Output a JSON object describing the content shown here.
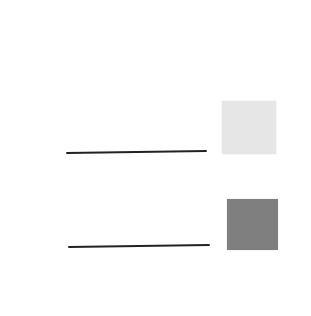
{
  "diagram": {
    "background": "#ffffff",
    "items": [
      {
        "id": "item-1",
        "label": "",
        "line": {
          "x1": 66,
          "y1": 153,
          "x2": 207,
          "y2": 151,
          "color": "#222222",
          "width": 2
        },
        "swatch": {
          "x": 222,
          "y": 101,
          "w": 54,
          "h": 53,
          "color": "#e6e6e6"
        }
      },
      {
        "id": "item-2",
        "label": "",
        "line": {
          "x1": 68,
          "y1": 247,
          "x2": 210,
          "y2": 245,
          "color": "#222222",
          "width": 2
        },
        "swatch": {
          "x": 227,
          "y": 199,
          "w": 51,
          "h": 51,
          "color": "#7f7f7f"
        }
      }
    ]
  }
}
